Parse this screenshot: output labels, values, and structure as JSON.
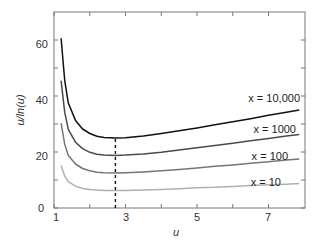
{
  "chart_data": {
    "type": "line",
    "title": "",
    "xlabel": "u",
    "ylabel": "u/ln(u)",
    "xlim": [
      1,
      8
    ],
    "ylim": [
      0,
      70
    ],
    "xticks": [
      1,
      3,
      5,
      7
    ],
    "xminor_ticks": [
      2,
      4,
      6
    ],
    "yticks": [
      0,
      20,
      40,
      60
    ],
    "yminor_ticks": [
      10,
      30,
      50
    ],
    "grid": false,
    "legend": "inline labels at right end of curves",
    "x": [
      1.2,
      1.3,
      1.4,
      1.6,
      1.8,
      2.0,
      2.2,
      2.4,
      2.718,
      3.0,
      3.5,
      4.0,
      4.5,
      5.0,
      5.5,
      6.0,
      6.5,
      7.0,
      7.5,
      7.86
    ],
    "series": [
      {
        "name": "x = 10,000",
        "color": "#111111",
        "values": [
          60.6,
          45.6,
          37.5,
          31.3,
          28.2,
          26.6,
          25.6,
          25.2,
          25.0,
          25.1,
          25.7,
          26.6,
          27.6,
          28.6,
          29.7,
          30.8,
          31.9,
          33.1,
          34.2,
          35.0
        ]
      },
      {
        "name": "x = 1000",
        "color": "#4a4a4a",
        "values": [
          45.5,
          34.2,
          28.1,
          23.5,
          21.2,
          19.9,
          19.2,
          18.9,
          18.8,
          18.9,
          19.3,
          19.9,
          20.7,
          21.5,
          22.3,
          23.1,
          24.0,
          24.8,
          25.7,
          26.3
        ]
      },
      {
        "name": "x = 100",
        "color": "#767676",
        "values": [
          30.3,
          22.8,
          18.7,
          15.7,
          14.1,
          13.3,
          12.8,
          12.6,
          12.5,
          12.6,
          12.9,
          13.3,
          13.8,
          14.3,
          14.9,
          15.4,
          16.0,
          16.5,
          17.1,
          17.5
        ]
      },
      {
        "name": "x = 10",
        "color": "#b0b0b0",
        "values": [
          15.2,
          11.4,
          9.4,
          7.8,
          7.0,
          6.6,
          6.4,
          6.3,
          6.26,
          6.3,
          6.4,
          6.6,
          6.9,
          7.2,
          7.4,
          7.7,
          8.0,
          8.3,
          8.5,
          8.7
        ]
      }
    ],
    "annotations": [
      {
        "type": "vertical-dashed-line",
        "x": 2.718,
        "y_from": 0,
        "y_to": 25.0,
        "note": "minimum at u = e"
      }
    ]
  },
  "labels": {
    "s0": "x = 10,000",
    "s1": "x = 1000",
    "s2": "x = 100",
    "s3": "x = 10",
    "xlabel": "u",
    "ylabel": "u/ln(u)",
    "xt0": "1",
    "xt1": "3",
    "xt2": "5",
    "xt3": "7",
    "yt0": "0",
    "yt1": "20",
    "yt2": "40",
    "yt3": "60"
  }
}
